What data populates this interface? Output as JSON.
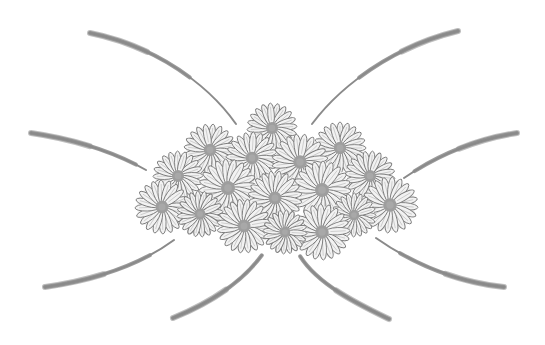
{
  "image": {
    "description": "Grayscale illustration of a fan-shaped cluster of daisy flowers with eight curved brush-stroke lines radiating outward",
    "width": 545,
    "height": 345,
    "background": "#ffffff",
    "colors": {
      "stroke": "#8a8a8a",
      "petal_fill": "#f2f2f2",
      "petal_outline": "#7a7a7a",
      "center": "#9e9e9e"
    },
    "flowers": [
      {
        "cx": 340,
        "cy": 148,
        "r": 26
      },
      {
        "cx": 210,
        "cy": 150,
        "r": 26
      },
      {
        "cx": 272,
        "cy": 128,
        "r": 25
      },
      {
        "cx": 252,
        "cy": 158,
        "r": 26
      },
      {
        "cx": 300,
        "cy": 162,
        "r": 28
      },
      {
        "cx": 178,
        "cy": 176,
        "r": 25
      },
      {
        "cx": 370,
        "cy": 176,
        "r": 25
      },
      {
        "cx": 228,
        "cy": 188,
        "r": 29
      },
      {
        "cx": 322,
        "cy": 190,
        "r": 29
      },
      {
        "cx": 275,
        "cy": 198,
        "r": 27
      },
      {
        "cx": 162,
        "cy": 207,
        "r": 27
      },
      {
        "cx": 390,
        "cy": 205,
        "r": 28
      },
      {
        "cx": 200,
        "cy": 214,
        "r": 23
      },
      {
        "cx": 354,
        "cy": 215,
        "r": 22
      },
      {
        "cx": 244,
        "cy": 226,
        "r": 27
      },
      {
        "cx": 322,
        "cy": 232,
        "r": 28
      },
      {
        "cx": 285,
        "cy": 232,
        "r": 22
      }
    ],
    "strokes": [
      {
        "name": "top-left-stroke",
        "d": "M90,33 C150,45 205,80 236,124"
      },
      {
        "name": "top-right-stroke",
        "d": "M458,31 C400,45 345,80 312,124"
      },
      {
        "name": "mid-left-stroke",
        "d": "M31,133 C80,140 120,155 146,170"
      },
      {
        "name": "mid-right-stroke",
        "d": "M517,133 C470,140 430,160 404,178"
      },
      {
        "name": "low-left-stroke",
        "d": "M45,287 C95,280 140,265 174,240"
      },
      {
        "name": "low-right-stroke",
        "d": "M504,287 C455,282 410,262 376,238"
      },
      {
        "name": "bottom-left-stroke",
        "d": "M173,318 C205,305 240,285 262,255"
      },
      {
        "name": "bottom-right-stroke",
        "d": "M389,319 C360,305 318,285 300,256"
      }
    ]
  }
}
